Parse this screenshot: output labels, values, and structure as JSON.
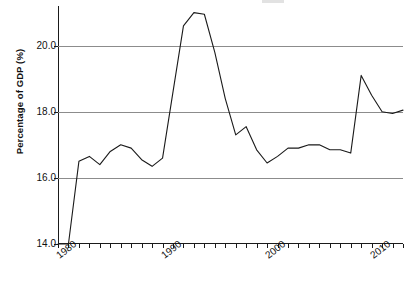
{
  "chart_data": {
    "type": "line",
    "title": "",
    "xlabel": "",
    "ylabel": "Percentage of GDP (%)",
    "xlim": [
      1980,
      2013
    ],
    "ylim": [
      14.0,
      21.2
    ],
    "grid": true,
    "legend": "none",
    "y_ticks": [
      "14.0",
      "16.0",
      "18.0",
      "20.0"
    ],
    "y_tick_values": [
      14.0,
      16.0,
      18.0,
      20.0
    ],
    "x_ticks": [
      "1980",
      "1990",
      "2000",
      "2010"
    ],
    "x_tick_values": [
      1980,
      1990,
      2000,
      2010
    ],
    "x_minor_tick_interval": 1,
    "series": [
      {
        "name": "Percentage of GDP",
        "color": "#1a1a1a",
        "x": [
          1980,
          1981,
          1982,
          1983,
          1984,
          1985,
          1986,
          1987,
          1988,
          1989,
          1990,
          1991,
          1992,
          1993,
          1994,
          1995,
          1996,
          1997,
          1998,
          1999,
          2000,
          2001,
          2002,
          2003,
          2004,
          2005,
          2006,
          2007,
          2008,
          2009,
          2010,
          2011,
          2012,
          2013
        ],
        "values": [
          14.0,
          14.0,
          16.5,
          16.65,
          16.4,
          16.8,
          17.0,
          16.9,
          16.55,
          16.35,
          16.6,
          18.6,
          20.6,
          21.0,
          20.95,
          19.8,
          18.4,
          17.3,
          17.55,
          16.85,
          16.45,
          16.65,
          16.9,
          16.9,
          17.0,
          17.0,
          16.85,
          16.85,
          16.75,
          19.1,
          18.5,
          18.0,
          17.95,
          18.05
        ]
      }
    ]
  },
  "axis": {
    "y_label_text": "Percentage of GDP (%)"
  }
}
